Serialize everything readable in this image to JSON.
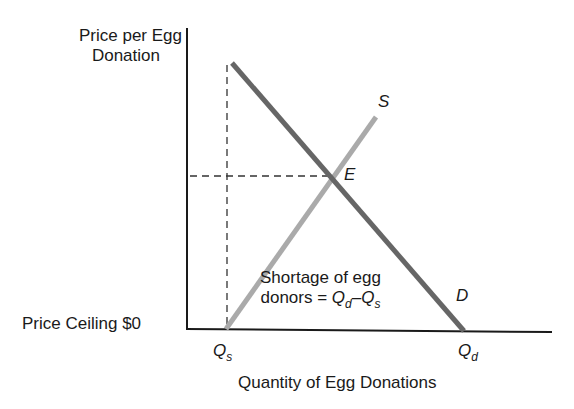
{
  "diagram": {
    "y_axis_label_line1": "Price per Egg",
    "y_axis_label_line2": "Donation",
    "x_axis_label": "Quantity of Egg Donations",
    "price_ceiling_label": "Price Ceiling $0",
    "supply_label": "S",
    "demand_label": "D",
    "equilibrium_label": "E",
    "qs_label": "Q",
    "qs_sub": "s",
    "qd_label": "Q",
    "qd_sub": "d",
    "shortage_line1": "Shortage of egg",
    "shortage_line2_prefix": "donors = ",
    "shortage_q1": "Q",
    "shortage_q1_sub": "d",
    "shortage_dash": "–",
    "shortage_q2": "Q",
    "shortage_q2_sub": "s",
    "colors": {
      "axis": "#1a1a1a",
      "demand": "#666666",
      "supply": "#aaaaaa",
      "dashed": "#333333"
    }
  }
}
